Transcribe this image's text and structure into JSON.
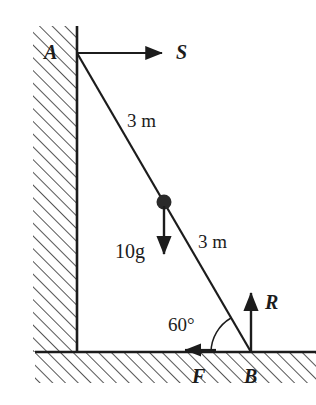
{
  "figure": {
    "type": "physics-free-body-diagram",
    "stroke_color": "#1c1c1c",
    "background_color": "#ffffff"
  },
  "points": {
    "A": {
      "label": "A",
      "x": 77,
      "y": 53,
      "note": "top of rod at wall"
    },
    "B": {
      "label": "B",
      "x": 251,
      "y": 352,
      "note": "foot of rod on ground"
    },
    "midpoint": {
      "x": 164,
      "y": 202,
      "note": "centre of mass marker"
    }
  },
  "geometry": {
    "wall": {
      "x": 33,
      "y": 26,
      "width": 44,
      "height": 326,
      "hatch": "diagonal"
    },
    "ground": {
      "x": 35,
      "y": 352,
      "width": 281,
      "height": 31,
      "hatch": "diagonal"
    },
    "rod": {
      "from": "A",
      "to": "B"
    }
  },
  "labels": {
    "point_a": "A",
    "point_b": "B",
    "force_s": "S",
    "force_r": "R",
    "force_f": "F",
    "weight": "10g",
    "length_upper": "3 m",
    "length_lower": "3 m",
    "angle": "60°"
  },
  "forces": [
    {
      "name": "S",
      "label": "S",
      "type": "wall reaction",
      "direction": "right",
      "at": "A",
      "tail": [
        77,
        53
      ],
      "head": [
        168,
        53
      ]
    },
    {
      "name": "10g",
      "label": "10g",
      "type": "weight",
      "direction": "down",
      "at": "midpoint",
      "tail": [
        164,
        204
      ],
      "head": [
        164,
        260
      ]
    },
    {
      "name": "R",
      "label": "R",
      "type": "normal reaction",
      "direction": "up",
      "at": "B",
      "tail": [
        251,
        352
      ],
      "head": [
        251,
        287
      ]
    },
    {
      "name": "F",
      "label": "F",
      "type": "friction",
      "direction": "left",
      "at": "ground",
      "tail": [
        216,
        350
      ],
      "head": [
        179,
        350
      ]
    }
  ],
  "dimensions": [
    {
      "label": "3 m",
      "segment": "A to midpoint"
    },
    {
      "label": "3 m",
      "segment": "midpoint to B"
    }
  ],
  "angle_arc": {
    "label": "60°",
    "vertex": "B",
    "between": [
      "ground",
      "rod"
    ],
    "radius": 40
  }
}
